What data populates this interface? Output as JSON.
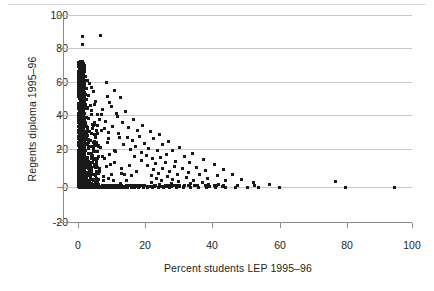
{
  "figure": {
    "title": "",
    "background_color": "#ffffff",
    "point_color": "#1a1a1a",
    "grid_color": "#c8c8c8",
    "axis_color": "#8c8c8c"
  },
  "chart_data": {
    "type": "scatter",
    "title": "",
    "xlabel": "Percent students LEP 1995–96",
    "ylabel": "Regents diploma 1995–96",
    "xlim": [
      -5,
      100
    ],
    "ylim": [
      -20,
      100
    ],
    "xticks": [
      0,
      20,
      40,
      60,
      80,
      100
    ],
    "yticks": [
      -20,
      0,
      20,
      40,
      60,
      80,
      100
    ],
    "xticklabels": [
      "0",
      "20",
      "40",
      "60",
      "80",
      "100"
    ],
    "yticklabels": [
      "-20",
      "0",
      "20",
      "40",
      "60",
      "80",
      "100"
    ],
    "grid": "horizontal",
    "legend": null,
    "marker": "square",
    "marker_size_px": 3,
    "points": [
      [
        1.2,
        87.5
      ],
      [
        1.3,
        83.0
      ],
      [
        6.8,
        88.0
      ],
      [
        0.6,
        73.0
      ],
      [
        0.9,
        71.0
      ],
      [
        1.1,
        69.5
      ],
      [
        0.5,
        68.0
      ],
      [
        1.4,
        67.0
      ],
      [
        0.8,
        66.0
      ],
      [
        1.0,
        65.0
      ],
      [
        2.2,
        64.5
      ],
      [
        0.6,
        64.0
      ],
      [
        1.7,
        63.0
      ],
      [
        0.9,
        62.5
      ],
      [
        2.8,
        62.0
      ],
      [
        0.7,
        61.5
      ],
      [
        1.5,
        61.0
      ],
      [
        8.6,
        61.0
      ],
      [
        0.5,
        60.5
      ],
      [
        1.1,
        60.0
      ],
      [
        3.3,
        60.0
      ],
      [
        0.8,
        59.5
      ],
      [
        2.0,
        59.0
      ],
      [
        1.3,
        58.5
      ],
      [
        0.6,
        58.0
      ],
      [
        3.9,
        58.0
      ],
      [
        1.0,
        57.5
      ],
      [
        2.5,
        57.0
      ],
      [
        0.7,
        56.5
      ],
      [
        1.6,
        56.0
      ],
      [
        0.9,
        55.5
      ],
      [
        4.6,
        55.5
      ],
      [
        1.2,
        55.0
      ],
      [
        0.5,
        54.5
      ],
      [
        2.1,
        54.0
      ],
      [
        1.4,
        53.5
      ],
      [
        0.8,
        53.0
      ],
      [
        3.0,
        53.0
      ],
      [
        1.0,
        52.5
      ],
      [
        0.6,
        52.0
      ],
      [
        1.8,
        51.5
      ],
      [
        2.6,
        51.0
      ],
      [
        0.9,
        50.5
      ],
      [
        1.3,
        50.0
      ],
      [
        0.7,
        49.5
      ],
      [
        5.2,
        50.0
      ],
      [
        1.5,
        49.0
      ],
      [
        1.1,
        48.5
      ],
      [
        0.5,
        48.0
      ],
      [
        2.3,
        48.0
      ],
      [
        3.6,
        47.5
      ],
      [
        0.8,
        47.0
      ],
      [
        1.7,
        46.5
      ],
      [
        1.0,
        46.0
      ],
      [
        0.6,
        45.5
      ],
      [
        2.9,
        45.5
      ],
      [
        1.4,
        45.0
      ],
      [
        0.9,
        44.5
      ],
      [
        4.1,
        44.5
      ],
      [
        1.2,
        44.0
      ],
      [
        0.7,
        43.5
      ],
      [
        2.0,
        43.0
      ],
      [
        1.6,
        42.5
      ],
      [
        0.5,
        42.0
      ],
      [
        5.9,
        42.0
      ],
      [
        1.0,
        41.5
      ],
      [
        1.3,
        41.0
      ],
      [
        0.8,
        40.5
      ],
      [
        2.5,
        40.5
      ],
      [
        3.2,
        40.0
      ],
      [
        1.5,
        39.5
      ],
      [
        0.9,
        39.0
      ],
      [
        1.1,
        38.5
      ],
      [
        6.5,
        39.0
      ],
      [
        0.6,
        38.0
      ],
      [
        2.1,
        37.5
      ],
      [
        1.4,
        37.0
      ],
      [
        1.0,
        36.5
      ],
      [
        0.7,
        36.0
      ],
      [
        4.3,
        36.5
      ],
      [
        1.8,
        35.5
      ],
      [
        1.2,
        35.0
      ],
      [
        0.5,
        34.5
      ],
      [
        2.7,
        34.5
      ],
      [
        1.6,
        34.0
      ],
      [
        0.9,
        33.5
      ],
      [
        7.8,
        34.0
      ],
      [
        1.3,
        33.0
      ],
      [
        1.0,
        32.5
      ],
      [
        0.6,
        32.0
      ],
      [
        3.4,
        32.0
      ],
      [
        2.2,
        31.5
      ],
      [
        1.5,
        31.0
      ],
      [
        0.8,
        30.5
      ],
      [
        1.1,
        30.0
      ],
      [
        5.1,
        30.5
      ],
      [
        1.7,
        29.5
      ],
      [
        0.7,
        29.0
      ],
      [
        2.4,
        28.5
      ],
      [
        1.3,
        28.0
      ],
      [
        1.0,
        27.5
      ],
      [
        0.5,
        27.0
      ],
      [
        9.2,
        28.0
      ],
      [
        3.8,
        27.0
      ],
      [
        1.9,
        26.5
      ],
      [
        1.4,
        26.0
      ],
      [
        0.9,
        25.5
      ],
      [
        1.2,
        25.0
      ],
      [
        0.6,
        24.5
      ],
      [
        2.8,
        24.5
      ],
      [
        6.1,
        24.0
      ],
      [
        1.6,
        23.5
      ],
      [
        1.0,
        23.0
      ],
      [
        0.8,
        22.5
      ],
      [
        4.5,
        22.5
      ],
      [
        1.3,
        22.0
      ],
      [
        2.1,
        21.5
      ],
      [
        1.5,
        21.0
      ],
      [
        0.7,
        20.5
      ],
      [
        1.1,
        20.0
      ],
      [
        11.3,
        20.5
      ],
      [
        3.1,
        19.5
      ],
      [
        1.8,
        19.0
      ],
      [
        0.9,
        18.5
      ],
      [
        1.4,
        18.0
      ],
      [
        0.5,
        17.5
      ],
      [
        7.2,
        18.0
      ],
      [
        2.5,
        17.0
      ],
      [
        1.2,
        16.5
      ],
      [
        1.6,
        16.0
      ],
      [
        0.8,
        15.5
      ],
      [
        5.4,
        15.5
      ],
      [
        1.0,
        15.0
      ],
      [
        2.0,
        14.5
      ],
      [
        1.3,
        14.0
      ],
      [
        0.6,
        13.5
      ],
      [
        3.7,
        13.5
      ],
      [
        1.7,
        13.0
      ],
      [
        9.8,
        13.0
      ],
      [
        1.1,
        12.5
      ],
      [
        0.9,
        12.0
      ],
      [
        2.3,
        11.5
      ],
      [
        1.4,
        11.0
      ],
      [
        0.7,
        10.5
      ],
      [
        6.3,
        11.0
      ],
      [
        1.9,
        10.0
      ],
      [
        1.2,
        9.5
      ],
      [
        4.0,
        9.5
      ],
      [
        0.5,
        9.0
      ],
      [
        1.5,
        8.5
      ],
      [
        2.6,
        8.0
      ],
      [
        1.0,
        7.5
      ],
      [
        0.8,
        7.0
      ],
      [
        13.1,
        8.0
      ],
      [
        3.2,
        6.5
      ],
      [
        1.6,
        6.0
      ],
      [
        1.1,
        5.5
      ],
      [
        7.6,
        6.0
      ],
      [
        2.1,
        5.0
      ],
      [
        0.6,
        4.5
      ],
      [
        1.3,
        4.0
      ],
      [
        4.8,
        4.5
      ],
      [
        1.8,
        3.5
      ],
      [
        0.9,
        3.0
      ],
      [
        2.9,
        3.0
      ],
      [
        10.5,
        3.5
      ],
      [
        1.4,
        2.5
      ],
      [
        0.7,
        2.0
      ],
      [
        5.7,
        2.0
      ],
      [
        2.2,
        1.5
      ],
      [
        1.0,
        1.0
      ],
      [
        3.5,
        1.0
      ],
      [
        1.5,
        0.5
      ],
      [
        0.5,
        0.0
      ],
      [
        0.8,
        0.0
      ],
      [
        1.1,
        0.0
      ],
      [
        1.4,
        0.0
      ],
      [
        1.7,
        0.0
      ],
      [
        2.0,
        0.0
      ],
      [
        2.4,
        0.0
      ],
      [
        2.8,
        0.0
      ],
      [
        3.2,
        0.0
      ],
      [
        3.6,
        0.0
      ],
      [
        4.1,
        0.0
      ],
      [
        4.5,
        0.0
      ],
      [
        5.0,
        0.0
      ],
      [
        5.5,
        0.0
      ],
      [
        6.0,
        0.0
      ],
      [
        6.6,
        0.0
      ],
      [
        7.1,
        0.0
      ],
      [
        7.7,
        0.0
      ],
      [
        8.3,
        0.0
      ],
      [
        9.0,
        0.0
      ],
      [
        9.7,
        0.0
      ],
      [
        10.4,
        0.0
      ],
      [
        11.2,
        0.0
      ],
      [
        12.0,
        0.0
      ],
      [
        12.9,
        0.0
      ],
      [
        13.8,
        0.0
      ],
      [
        14.8,
        0.0
      ],
      [
        15.9,
        0.0
      ],
      [
        17.0,
        0.0
      ],
      [
        18.2,
        0.0
      ],
      [
        19.5,
        0.0
      ],
      [
        20.9,
        0.0
      ],
      [
        22.4,
        0.0
      ],
      [
        24.0,
        0.0
      ],
      [
        25.7,
        0.0
      ],
      [
        27.5,
        0.0
      ],
      [
        29.4,
        0.0
      ],
      [
        31.5,
        0.0
      ],
      [
        33.7,
        0.0
      ],
      [
        36.1,
        0.0
      ],
      [
        38.6,
        0.0
      ],
      [
        41.3,
        0.0
      ],
      [
        44.2,
        0.0
      ],
      [
        47.3,
        0.0
      ],
      [
        50.6,
        0.0
      ],
      [
        54.0,
        0.0
      ],
      [
        60.2,
        0.0
      ],
      [
        80.1,
        0.0
      ],
      [
        94.8,
        0.0
      ],
      [
        12.6,
        52.0
      ],
      [
        10.1,
        47.0
      ],
      [
        14.2,
        44.0
      ],
      [
        11.8,
        41.0
      ],
      [
        16.5,
        39.0
      ],
      [
        13.4,
        37.5
      ],
      [
        19.2,
        36.0
      ],
      [
        15.1,
        34.5
      ],
      [
        17.8,
        33.0
      ],
      [
        21.6,
        32.0
      ],
      [
        12.1,
        31.0
      ],
      [
        24.3,
        30.5
      ],
      [
        18.4,
        29.5
      ],
      [
        14.9,
        28.5
      ],
      [
        22.7,
        28.0
      ],
      [
        16.2,
        27.0
      ],
      [
        27.1,
        26.5
      ],
      [
        19.8,
        25.5
      ],
      [
        13.7,
        25.0
      ],
      [
        25.4,
        24.5
      ],
      [
        17.3,
        23.5
      ],
      [
        30.5,
        23.0
      ],
      [
        21.1,
        22.5
      ],
      [
        15.6,
        22.0
      ],
      [
        28.2,
        21.5
      ],
      [
        23.8,
        21.0
      ],
      [
        18.9,
        20.0
      ],
      [
        34.2,
        19.5
      ],
      [
        26.6,
        19.0
      ],
      [
        20.4,
        18.5
      ],
      [
        16.8,
        18.0
      ],
      [
        31.9,
        17.5
      ],
      [
        24.7,
        17.0
      ],
      [
        22.3,
        16.5
      ],
      [
        37.6,
        16.0
      ],
      [
        19.1,
        15.5
      ],
      [
        29.3,
        15.0
      ],
      [
        26.1,
        14.5
      ],
      [
        33.5,
        14.0
      ],
      [
        23.2,
        13.5
      ],
      [
        40.8,
        13.0
      ],
      [
        20.7,
        12.5
      ],
      [
        28.9,
        12.0
      ],
      [
        35.4,
        11.5
      ],
      [
        25.3,
        11.0
      ],
      [
        31.2,
        10.5
      ],
      [
        22.6,
        10.0
      ],
      [
        43.5,
        10.0
      ],
      [
        38.1,
        9.5
      ],
      [
        27.4,
        9.0
      ],
      [
        33.0,
        8.5
      ],
      [
        24.1,
        8.0
      ],
      [
        29.7,
        7.5
      ],
      [
        46.2,
        7.5
      ],
      [
        36.3,
        7.0
      ],
      [
        21.9,
        6.5
      ],
      [
        41.7,
        6.5
      ],
      [
        26.8,
        6.0
      ],
      [
        32.4,
        5.5
      ],
      [
        23.5,
        5.0
      ],
      [
        38.9,
        5.0
      ],
      [
        28.3,
        4.5
      ],
      [
        49.1,
        4.5
      ],
      [
        34.6,
        4.0
      ],
      [
        25.0,
        3.5
      ],
      [
        44.3,
        3.5
      ],
      [
        30.1,
        3.0
      ],
      [
        22.1,
        2.5
      ],
      [
        37.2,
        2.5
      ],
      [
        27.9,
        2.0
      ],
      [
        52.4,
        2.5
      ],
      [
        33.8,
        2.0
      ],
      [
        24.5,
        1.5
      ],
      [
        42.0,
        1.5
      ],
      [
        29.0,
        1.0
      ],
      [
        35.9,
        1.0
      ],
      [
        26.3,
        0.5
      ],
      [
        47.8,
        1.0
      ],
      [
        31.6,
        0.5
      ],
      [
        23.0,
        0.5
      ],
      [
        39.5,
        0.5
      ],
      [
        77.0,
        3.0
      ],
      [
        57.3,
        1.5
      ],
      [
        10.8,
        56.0
      ],
      [
        8.9,
        52.5
      ],
      [
        9.5,
        49.0
      ],
      [
        7.4,
        45.0
      ],
      [
        11.5,
        43.0
      ],
      [
        6.9,
        42.0
      ],
      [
        8.2,
        38.0
      ],
      [
        10.2,
        35.0
      ],
      [
        7.0,
        33.0
      ],
      [
        9.1,
        31.5
      ],
      [
        12.4,
        29.0
      ],
      [
        8.7,
        26.0
      ],
      [
        6.7,
        23.0
      ],
      [
        10.9,
        21.0
      ],
      [
        9.4,
        19.0
      ],
      [
        7.9,
        16.5
      ],
      [
        11.0,
        14.5
      ],
      [
        8.4,
        12.0
      ],
      [
        6.4,
        9.0
      ],
      [
        10.0,
        7.0
      ],
      [
        9.0,
        5.0
      ],
      [
        7.5,
        3.5
      ],
      [
        12.8,
        2.0
      ],
      [
        14.5,
        4.0
      ],
      [
        16.0,
        6.5
      ],
      [
        13.0,
        10.5
      ],
      [
        15.3,
        12.5
      ],
      [
        17.6,
        9.0
      ],
      [
        14.0,
        7.0
      ]
    ]
  },
  "axes": {
    "x": {
      "label": "Percent students LEP 1995–96",
      "ticks": [
        "0",
        "20",
        "40",
        "60",
        "80",
        "100"
      ]
    },
    "y": {
      "label": "Regents diploma 1995–96",
      "ticks": [
        "100",
        "80",
        "60",
        "40",
        "20",
        "0",
        "-20"
      ]
    }
  }
}
